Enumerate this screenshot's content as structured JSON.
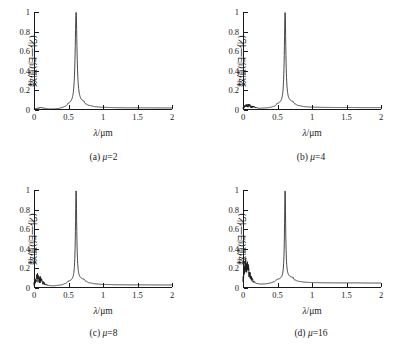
{
  "figure": {
    "axis_title_y": "数值(归一化)",
    "axis_title_x_symbol": "λ",
    "axis_title_x_unit": "/μm",
    "x_ticks": [
      "0",
      "0.5",
      "1",
      "1.5",
      "2"
    ],
    "y_ticks": [
      "0",
      "0.2",
      "0.4",
      "0.6",
      "0.8",
      "1"
    ],
    "line_color": "#1a1a1a",
    "background": "#ffffff"
  },
  "panels": [
    {
      "caption_index": "(a)",
      "caption_param": "μ",
      "caption_value": "=2",
      "caption_full": "(a) μ=2"
    },
    {
      "caption_index": "(b)",
      "caption_param": "μ",
      "caption_value": "=4",
      "caption_full": "(b) μ=4"
    },
    {
      "caption_index": "(c)",
      "caption_param": "μ",
      "caption_value": "=8",
      "caption_full": "(c) μ=8"
    },
    {
      "caption_index": "(d)",
      "caption_param": "μ",
      "caption_value": "=16",
      "caption_full": "(d) μ=16"
    }
  ],
  "chart_data": {
    "type": "line",
    "title": "",
    "xlabel": "λ/μm",
    "ylabel": "数值(归一化)",
    "xlim": [
      0,
      2
    ],
    "ylim": [
      0,
      1
    ],
    "xticks": [
      0,
      0.5,
      1,
      1.5,
      2
    ],
    "yticks": [
      0,
      0.2,
      0.4,
      0.6,
      0.8,
      1
    ],
    "grid": false,
    "legend": "none",
    "peak_center_um": 0.61,
    "peak_value": 1.0,
    "subplots": [
      {
        "name": "(a) μ=2",
        "mu": 2,
        "peak_center_um": 0.61,
        "peak_value": 1.0,
        "peak_halfwidth_um": 0.016,
        "low_lambda_noise_amplitude": 0.012,
        "low_lambda_noise_center_um": 0.09,
        "baseline_tail_level": 0.022,
        "x": [
          0,
          0.05,
          0.1,
          0.15,
          0.2,
          0.25,
          0.3,
          0.35,
          0.4,
          0.45,
          0.5,
          0.55,
          0.58,
          0.6,
          0.61,
          0.62,
          0.64,
          0.67,
          0.7,
          0.75,
          0.8,
          0.9,
          1.0,
          1.2,
          1.4,
          1.6,
          1.8,
          2.0
        ],
        "y": [
          0.005,
          0.012,
          0.014,
          0.012,
          0.009,
          0.008,
          0.009,
          0.012,
          0.018,
          0.028,
          0.045,
          0.12,
          0.3,
          0.72,
          1.0,
          0.7,
          0.28,
          0.12,
          0.08,
          0.05,
          0.04,
          0.03,
          0.026,
          0.023,
          0.022,
          0.022,
          0.021,
          0.021
        ]
      },
      {
        "name": "(b) μ=4",
        "mu": 4,
        "peak_center_um": 0.61,
        "peak_value": 1.0,
        "peak_halfwidth_um": 0.013,
        "low_lambda_noise_amplitude": 0.035,
        "low_lambda_noise_center_um": 0.07,
        "baseline_tail_level": 0.025,
        "x": [
          0,
          0.03,
          0.06,
          0.09,
          0.12,
          0.16,
          0.2,
          0.25,
          0.3,
          0.35,
          0.4,
          0.45,
          0.5,
          0.55,
          0.58,
          0.6,
          0.61,
          0.62,
          0.64,
          0.67,
          0.7,
          0.75,
          0.8,
          0.9,
          1.0,
          1.2,
          1.4,
          1.6,
          1.8,
          2.0
        ],
        "y": [
          0.008,
          0.03,
          0.022,
          0.033,
          0.02,
          0.026,
          0.018,
          0.016,
          0.018,
          0.02,
          0.024,
          0.032,
          0.05,
          0.13,
          0.32,
          0.74,
          1.0,
          0.72,
          0.3,
          0.13,
          0.085,
          0.055,
          0.042,
          0.032,
          0.028,
          0.026,
          0.025,
          0.025,
          0.024,
          0.024
        ]
      },
      {
        "name": "(c) μ=8",
        "mu": 8,
        "peak_center_um": 0.61,
        "peak_value": 1.0,
        "peak_halfwidth_um": 0.011,
        "low_lambda_noise_amplitude": 0.08,
        "low_lambda_noise_center_um": 0.06,
        "baseline_tail_level": 0.032,
        "x": [
          0,
          0.02,
          0.04,
          0.05,
          0.06,
          0.07,
          0.08,
          0.1,
          0.12,
          0.15,
          0.2,
          0.25,
          0.3,
          0.35,
          0.4,
          0.45,
          0.5,
          0.55,
          0.58,
          0.6,
          0.61,
          0.62,
          0.64,
          0.67,
          0.7,
          0.75,
          0.8,
          0.9,
          1.0,
          1.2,
          1.4,
          1.6,
          1.8,
          2.0
        ],
        "y": [
          0.012,
          0.045,
          0.062,
          0.08,
          0.055,
          0.072,
          0.048,
          0.055,
          0.038,
          0.032,
          0.026,
          0.022,
          0.022,
          0.026,
          0.03,
          0.04,
          0.058,
          0.14,
          0.33,
          0.75,
          1.0,
          0.73,
          0.31,
          0.14,
          0.095,
          0.065,
          0.05,
          0.04,
          0.036,
          0.033,
          0.032,
          0.032,
          0.031,
          0.031
        ]
      },
      {
        "name": "(d) μ=16",
        "mu": 16,
        "peak_center_um": 0.61,
        "peak_value": 1.0,
        "peak_halfwidth_um": 0.01,
        "low_lambda_noise_amplitude": 0.17,
        "low_lambda_noise_center_um": 0.05,
        "baseline_tail_level": 0.052,
        "x": [
          0,
          0.015,
          0.03,
          0.04,
          0.05,
          0.06,
          0.07,
          0.08,
          0.09,
          0.1,
          0.12,
          0.15,
          0.2,
          0.25,
          0.3,
          0.35,
          0.4,
          0.45,
          0.5,
          0.55,
          0.58,
          0.6,
          0.61,
          0.62,
          0.64,
          0.67,
          0.7,
          0.75,
          0.8,
          0.9,
          1.0,
          1.2,
          1.4,
          1.6,
          1.8,
          2.0
        ],
        "y": [
          0.02,
          0.09,
          0.13,
          0.165,
          0.12,
          0.17,
          0.11,
          0.14,
          0.085,
          0.095,
          0.07,
          0.055,
          0.045,
          0.04,
          0.04,
          0.044,
          0.05,
          0.06,
          0.08,
          0.16,
          0.34,
          0.76,
          1.0,
          0.74,
          0.32,
          0.15,
          0.105,
          0.078,
          0.066,
          0.058,
          0.055,
          0.053,
          0.052,
          0.052,
          0.051,
          0.051
        ]
      }
    ]
  }
}
